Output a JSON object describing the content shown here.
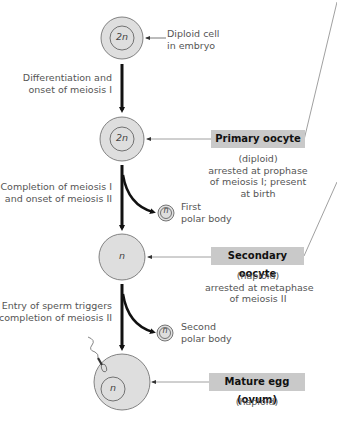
{
  "diagram": {
    "type": "oogenesis flowchart",
    "colors": {
      "cell_fill": "#dedede",
      "cell_stroke": "#666666",
      "label_box": "#c9c9c9",
      "arrow": "#111111",
      "leader_line": "#888888"
    },
    "cells": [
      {
        "id": "embryo-cell",
        "ploidy_label": "2n",
        "annotation": [
          "Diploid cell",
          "in embryo"
        ]
      },
      {
        "id": "primary-oocyte",
        "ploidy_label": "2n"
      },
      {
        "id": "secondary-oocyte",
        "ploidy_label": "n"
      },
      {
        "id": "mature-egg",
        "ploidy_label": "n"
      }
    ],
    "transitions": [
      {
        "lines": [
          "Differentiation and",
          "onset of meiosis I"
        ]
      },
      {
        "lines": [
          "Completion of meiosis I",
          "and onset of meiosis II"
        ]
      },
      {
        "lines": [
          "Entry of sperm triggers",
          "completion of meiosis II"
        ]
      }
    ],
    "polar_bodies": [
      {
        "ploidy_label": "n",
        "lines": [
          "First",
          "polar body"
        ]
      },
      {
        "ploidy_label": "n",
        "lines": [
          "Second",
          "polar body"
        ]
      }
    ],
    "stages": [
      {
        "title": "Primary oocyte",
        "lines": [
          "(diploid)",
          "arrested at prophase",
          "of meiosis I; present",
          "at birth"
        ]
      },
      {
        "title": "Secondary oocyte",
        "lines": [
          "(haploid)",
          "arrested at metaphase",
          "of meiosis II"
        ]
      },
      {
        "title": "Mature egg (ovum)",
        "lines": [
          "(haploid)"
        ]
      }
    ]
  }
}
